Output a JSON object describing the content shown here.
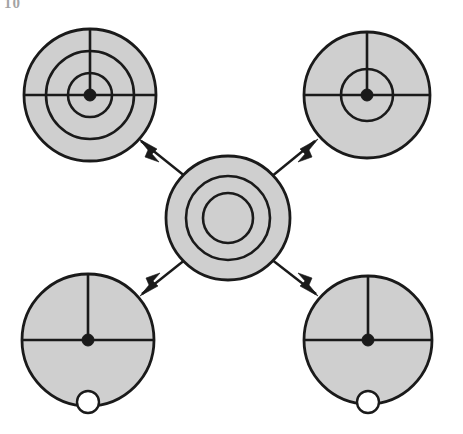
{
  "figure": {
    "caption_fragment": "10",
    "background_color": "#ffffff",
    "ink_color": "#1a1a1a",
    "fill_color": "#cfcfcf",
    "port_fill_color": "#ffffff",
    "width": 463,
    "height": 434
  },
  "diagram": {
    "type": "radial-hub-and-spoke",
    "hub": {
      "name": "center-node",
      "label": "",
      "cx": 228,
      "cy": 218,
      "radii": [
        62,
        42,
        25
      ],
      "ring_count": 3,
      "has_crosshair": false,
      "has_hub_dot": false,
      "has_port": false,
      "stroke_width": 2.6
    },
    "satellites": [
      {
        "name": "top-left-node",
        "label": "",
        "position": "top-left",
        "cx": 90,
        "cy": 95,
        "radii": [
          66,
          44,
          22
        ],
        "ring_count": 3,
        "has_crosshair": true,
        "has_hub_dot": true,
        "hub_dot_radius": 6,
        "has_port": false,
        "stroke_width": 2.6
      },
      {
        "name": "top-right-node",
        "label": "",
        "position": "top-right",
        "cx": 367,
        "cy": 95,
        "radii": [
          63,
          26
        ],
        "ring_count": 2,
        "has_crosshair": true,
        "has_hub_dot": true,
        "hub_dot_radius": 6,
        "has_port": false,
        "stroke_width": 2.6
      },
      {
        "name": "bottom-left-node",
        "label": "",
        "position": "bottom-left",
        "cx": 88,
        "cy": 340,
        "radii": [
          66
        ],
        "ring_count": 1,
        "has_crosshair": true,
        "has_hub_dot": true,
        "hub_dot_radius": 6,
        "has_port": true,
        "port_offset_y": 62,
        "port_radius": 11,
        "stroke_width": 2.6
      },
      {
        "name": "bottom-right-node",
        "label": "",
        "position": "bottom-right",
        "cx": 368,
        "cy": 340,
        "radii": [
          64
        ],
        "ring_count": 1,
        "has_crosshair": true,
        "has_hub_dot": true,
        "hub_dot_radius": 6,
        "has_port": true,
        "port_offset_y": 62,
        "port_radius": 11,
        "stroke_width": 2.6
      }
    ],
    "connectors": [
      {
        "name": "connector-hub-to-top-left",
        "from": "center-node",
        "to": "top-left-node",
        "direction": "outward",
        "arrowhead_at": "to",
        "x1": 186,
        "y1": 177,
        "x2": 141,
        "y2": 141,
        "stroke_width": 2.4
      },
      {
        "name": "connector-hub-to-top-right",
        "from": "center-node",
        "to": "top-right-node",
        "direction": "outward",
        "arrowhead_at": "to",
        "x1": 271,
        "y1": 177,
        "x2": 315,
        "y2": 141,
        "stroke_width": 2.4
      },
      {
        "name": "connector-hub-to-bottom-left",
        "from": "center-node",
        "to": "bottom-left-node",
        "direction": "outward",
        "arrowhead_at": "to",
        "x1": 186,
        "y1": 259,
        "x2": 142,
        "y2": 294,
        "stroke_width": 2.4
      },
      {
        "name": "connector-hub-to-bottom-right",
        "from": "center-node",
        "to": "bottom-right-node",
        "direction": "outward",
        "arrowhead_at": "to",
        "x1": 271,
        "y1": 259,
        "x2": 316,
        "y2": 294,
        "stroke_width": 2.4
      }
    ]
  }
}
